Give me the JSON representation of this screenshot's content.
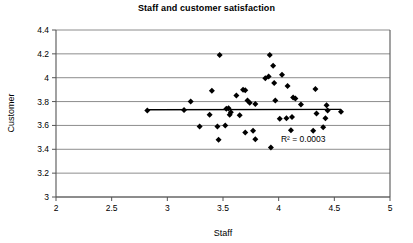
{
  "chart_data": {
    "type": "scatter",
    "title": "Staff and customer satisfaction",
    "xlabel": "Staff",
    "ylabel": "Customer",
    "xlim": [
      2,
      5
    ],
    "ylim": [
      3,
      4.4
    ],
    "xticks": [
      "2",
      "2.5",
      "3",
      "3.5",
      "4",
      "4.5",
      "5"
    ],
    "xtick_values": [
      2,
      2.5,
      3,
      3.5,
      4,
      4.5,
      5
    ],
    "yticks": [
      "3",
      "3.2",
      "3.4",
      "3.6",
      "3.8",
      "4",
      "4.2",
      "4.4"
    ],
    "ytick_values": [
      3,
      3.2,
      3.4,
      3.6,
      3.8,
      4,
      4.2,
      4.4
    ],
    "grid": "horizontal",
    "legend": "none",
    "marker": "diamond",
    "marker_color": "#000000",
    "gridline_color": "#808080",
    "axis_color": "#555555",
    "annotation": "R² = 0.0003",
    "annotation_x": 4.02,
    "annotation_y": 3.46,
    "trendline": {
      "x_start": 2.82,
      "y_start": 3.731,
      "x_end": 4.56,
      "y_end": 3.735,
      "color": "#000000",
      "r_squared": 0.0003
    },
    "points": [
      [
        2.82,
        3.725
      ],
      [
        3.15,
        3.73
      ],
      [
        3.21,
        3.8
      ],
      [
        3.29,
        3.59
      ],
      [
        3.38,
        3.69
      ],
      [
        3.4,
        3.89
      ],
      [
        3.45,
        3.59
      ],
      [
        3.46,
        3.48
      ],
      [
        3.47,
        4.19
      ],
      [
        3.52,
        3.6
      ],
      [
        3.53,
        3.74
      ],
      [
        3.55,
        3.745
      ],
      [
        3.56,
        3.69
      ],
      [
        3.57,
        3.71
      ],
      [
        3.62,
        3.85
      ],
      [
        3.65,
        3.685
      ],
      [
        3.68,
        3.9
      ],
      [
        3.7,
        3.895
      ],
      [
        3.7,
        3.54
      ],
      [
        3.72,
        3.81
      ],
      [
        3.74,
        3.79
      ],
      [
        3.77,
        3.555
      ],
      [
        3.79,
        3.78
      ],
      [
        3.79,
        3.485
      ],
      [
        3.88,
        3.995
      ],
      [
        3.91,
        4.01
      ],
      [
        3.92,
        4.19
      ],
      [
        3.93,
        3.415
      ],
      [
        3.95,
        4.1
      ],
      [
        3.96,
        3.955
      ],
      [
        3.97,
        3.81
      ],
      [
        4.01,
        3.655
      ],
      [
        4.03,
        4.025
      ],
      [
        4.07,
        3.66
      ],
      [
        4.08,
        3.93
      ],
      [
        4.11,
        3.56
      ],
      [
        4.12,
        3.67
      ],
      [
        4.13,
        3.835
      ],
      [
        4.15,
        3.825
      ],
      [
        4.2,
        3.775
      ],
      [
        4.31,
        3.555
      ],
      [
        4.33,
        3.905
      ],
      [
        4.34,
        3.7
      ],
      [
        4.4,
        3.585
      ],
      [
        4.42,
        3.66
      ],
      [
        4.43,
        3.77
      ],
      [
        4.44,
        3.725
      ],
      [
        4.56,
        3.715
      ]
    ]
  }
}
